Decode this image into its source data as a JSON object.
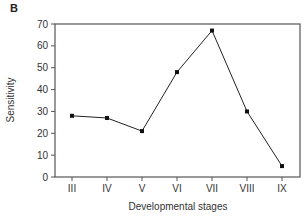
{
  "panel_label": "B",
  "chart_data": {
    "type": "line",
    "title": "",
    "xlabel": "Developmental stages",
    "ylabel": "Sensitivity",
    "categories": [
      "III",
      "IV",
      "V",
      "VI",
      "VII",
      "VIII",
      "IX"
    ],
    "values": [
      28,
      27,
      21,
      48,
      67,
      30,
      5
    ],
    "ylim": [
      0,
      70
    ],
    "yticks": [
      0,
      10,
      20,
      30,
      40,
      50,
      60,
      70
    ],
    "grid": false,
    "legend": null,
    "marker": "square",
    "line_color": "#222222"
  }
}
